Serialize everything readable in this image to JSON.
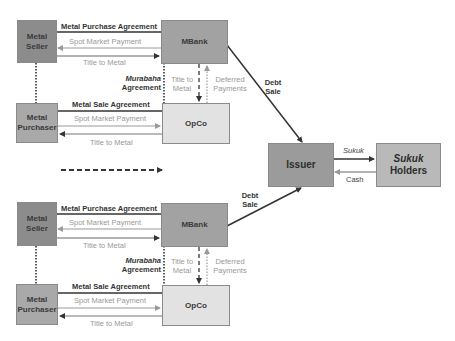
{
  "diagram": {
    "type": "sukuk-structure-flow",
    "colors": {
      "seller_box": "#8c8c8c",
      "purchaser_box": "#a9a9a9",
      "mbank_box": "#a2a2a2",
      "opco_box": "#e2e2e2",
      "issuer_box": "#9b9b9b",
      "holders_box": "#b9b9b9",
      "dark_line": "#333333",
      "gray_line": "#9a9a9a"
    },
    "top_cluster": {
      "metal_seller": "Metal\nSeller",
      "metal_seller_l1": "Metal",
      "metal_seller_l2": "Seller",
      "metal_purchaser_l1": "Metal",
      "metal_purchaser_l2": "Purchaser",
      "mbank": "MBank",
      "opco": "OpCo",
      "metal_purchase_agreement": "Metal Purchase Agreement",
      "spot_market_payment_1": "Spot Market Payment",
      "title_to_metal_1": "Title to Metal",
      "metal_sale_agreement": "Metal Sale Agreement",
      "spot_market_payment_2": "Spot Market Payment",
      "title_to_metal_2": "Title to Metal",
      "murabaha_l1": "Murabaha",
      "murabaha_l2": "Agreement",
      "title_vertical_l1": "Title to",
      "title_vertical_l2": "Metal",
      "deferred_l1": "Deferred",
      "deferred_l2": "Payments"
    },
    "bottom_cluster": {
      "metal_seller_l1": "Metal",
      "metal_seller_l2": "Seller",
      "metal_purchaser_l1": "Metal",
      "metal_purchaser_l2": "Purchaser",
      "mbank": "MBank",
      "opco": "OpCo",
      "metal_purchase_agreement": "Metal Purchase Agreement",
      "spot_market_payment_1": "Spot Market Payment",
      "title_to_metal_1": "Title to Metal",
      "metal_sale_agreement": "Metal Sale Agreement",
      "spot_market_payment_2": "Spot Market Payment",
      "title_to_metal_2": "Title to Metal",
      "murabaha_l1": "Murabaha",
      "murabaha_l2": "Agreement",
      "title_vertical_l1": "Title to",
      "title_vertical_l2": "Metal",
      "deferred_l1": "Deferred",
      "deferred_l2": "Payments"
    },
    "right": {
      "debt_sale_top_l1": "Debt",
      "debt_sale_top_l2": "Sale",
      "debt_sale_bottom_l1": "Debt",
      "debt_sale_bottom_l2": "Sale",
      "issuer": "Issuer",
      "sukuk_holders_l1": "Sukuk",
      "sukuk_holders_l2": "Holders",
      "sukuk_flow": "Sukuk",
      "cash_flow": "Cash"
    }
  }
}
